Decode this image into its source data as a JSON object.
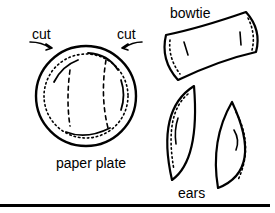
{
  "labels": {
    "cut_left": "cut",
    "cut_right": "cut",
    "bowtie": "bowtie",
    "paper_plate": "paper plate",
    "ears": "ears"
  },
  "colors": {
    "ink": "#000000",
    "background": "#ffffff"
  }
}
